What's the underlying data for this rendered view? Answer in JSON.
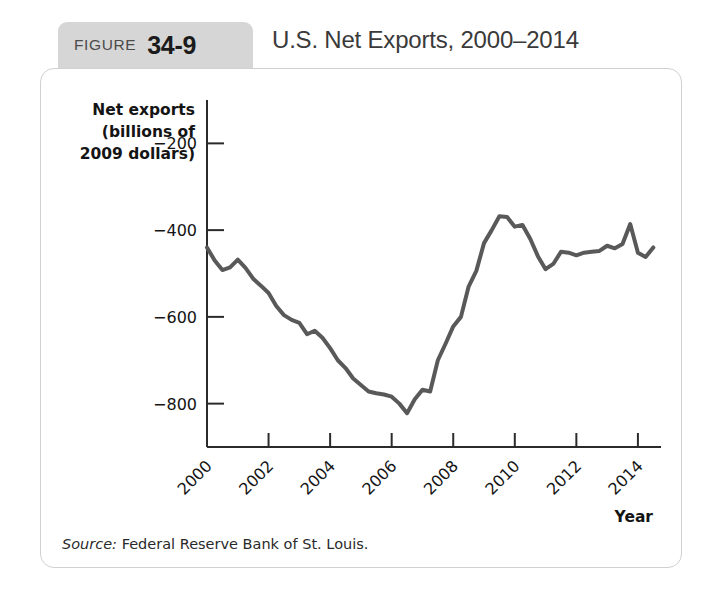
{
  "figure": {
    "tab_word": "FIGURE",
    "number": "34-9",
    "title": "U.S. Net Exports, 2000–2014",
    "source_label": "Source:",
    "source_text": "Federal Reserve Bank of St. Louis."
  },
  "chart_data": {
    "type": "line",
    "title": "U.S. Net Exports, 2000–2014",
    "xlabel": "Year",
    "ylabel": "Net exports (billions of 2009 dollars)",
    "ylabel_lines": [
      "Net exports",
      "(billions of",
      "2009 dollars)"
    ],
    "xlim": [
      2000,
      2014.75
    ],
    "ylim": [
      -900,
      -100
    ],
    "yticks": [
      -200,
      -400,
      -600,
      -800
    ],
    "ytick_labels": [
      "−200",
      "−400",
      "−600",
      "−800"
    ],
    "xticks": [
      2000,
      2002,
      2004,
      2006,
      2008,
      2010,
      2012,
      2014
    ],
    "xtick_labels": [
      "2000",
      "2002",
      "2004",
      "2006",
      "2008",
      "2010",
      "2012",
      "2014"
    ],
    "xtick_rotation_deg": 45,
    "grid": false,
    "legend": null,
    "line_color": "#595959",
    "line_width": 4,
    "series": [
      {
        "name": "U.S. Net Exports",
        "units": "billions of 2009 dollars",
        "x": [
          2000.0,
          2000.25,
          2000.5,
          2000.75,
          2001.0,
          2001.25,
          2001.5,
          2001.75,
          2002.0,
          2002.25,
          2002.5,
          2002.75,
          2003.0,
          2003.25,
          2003.5,
          2003.75,
          2004.0,
          2004.25,
          2004.5,
          2004.75,
          2005.0,
          2005.25,
          2005.5,
          2005.75,
          2006.0,
          2006.25,
          2006.5,
          2006.75,
          2007.0,
          2007.25,
          2007.5,
          2007.75,
          2008.0,
          2008.25,
          2008.5,
          2008.75,
          2009.0,
          2009.25,
          2009.5,
          2009.75,
          2010.0,
          2010.25,
          2010.5,
          2010.75,
          2011.0,
          2011.25,
          2011.5,
          2011.75,
          2012.0,
          2012.25,
          2012.5,
          2012.75,
          2013.0,
          2013.25,
          2013.5,
          2013.75,
          2014.0,
          2014.25,
          2014.5
        ],
        "y": [
          -440,
          -470,
          -492,
          -486,
          -468,
          -487,
          -512,
          -528,
          -545,
          -575,
          -596,
          -607,
          -614,
          -640,
          -632,
          -648,
          -672,
          -700,
          -718,
          -742,
          -757,
          -772,
          -776,
          -779,
          -784,
          -800,
          -822,
          -790,
          -768,
          -772,
          -700,
          -662,
          -622,
          -600,
          -530,
          -494,
          -430,
          -400,
          -368,
          -370,
          -392,
          -388,
          -420,
          -460,
          -490,
          -478,
          -450,
          -452,
          -458,
          -452,
          -450,
          -448,
          -436,
          -442,
          -432,
          -386,
          -452,
          -462,
          -440
        ]
      }
    ],
    "annotations": [
      {
        "text": "Trough of net exports near 2006",
        "x": 2006.5,
        "y": -822
      },
      {
        "text": "Peak (least negative) near 2009",
        "x": 2009.5,
        "y": -368
      }
    ]
  }
}
